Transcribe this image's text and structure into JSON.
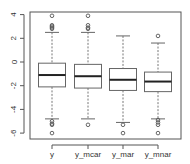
{
  "chart_data": {
    "type": "boxplot",
    "title": "",
    "xlabel": "",
    "ylabel": "",
    "ylim": [
      -6.2,
      4.3
    ],
    "y_ticks": [
      -6,
      -4,
      -2,
      0,
      2,
      4
    ],
    "y_tick_labels": [
      "-6",
      "-4",
      "-2",
      "0",
      "2",
      "4"
    ],
    "grid": false,
    "legend": null,
    "categories": [
      "y",
      "y_mcar",
      "y_mar",
      "y_mnar"
    ],
    "series": [
      {
        "name": "y",
        "whisker_low": -4.8,
        "q1": -2.1,
        "median": -1.1,
        "q3": -0.1,
        "whisker_high": 2.5,
        "outliers": [
          3.9,
          3.1,
          3.0,
          2.9,
          2.8,
          -5.0,
          -5.2,
          -5.3,
          -6.0
        ]
      },
      {
        "name": "y_mcar",
        "whisker_low": -4.8,
        "q1": -2.2,
        "median": -1.2,
        "q3": -0.2,
        "whisker_high": 2.5,
        "outliers": [
          3.9,
          3.1,
          2.9,
          2.8,
          -5.3
        ]
      },
      {
        "name": "y_mar",
        "whisker_low": -5.1,
        "q1": -2.4,
        "median": -1.5,
        "q3": -0.55,
        "whisker_high": 2.2,
        "outliers": [
          -5.3,
          -6.0
        ]
      },
      {
        "name": "y_mnar",
        "whisker_low": -4.8,
        "q1": -2.5,
        "median": -1.65,
        "q3": -0.85,
        "whisker_high": 1.6,
        "outliers": [
          2.2,
          -4.9,
          -5.1,
          -5.3,
          -6.0
        ]
      }
    ]
  },
  "colors": {
    "axis": "#555555",
    "box": "#666666",
    "median": "#222222",
    "whisker": "#777777",
    "outlier": "#555555"
  }
}
